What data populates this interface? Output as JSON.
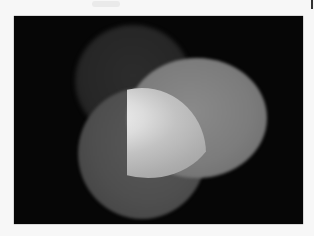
{
  "image": {
    "description": "Grayscale photograph of three overlapping light ellipses on a black background",
    "background_color": "#060606",
    "page_color": "#f7f7f7",
    "shapes": [
      {
        "name": "top-left dim ellipse",
        "color": "#2c2c2c"
      },
      {
        "name": "bottom-left ellipse",
        "color": "#555555"
      },
      {
        "name": "right ellipse",
        "color": "#858585"
      },
      {
        "name": "bright overlap",
        "color": "#f0f0f0"
      }
    ]
  }
}
